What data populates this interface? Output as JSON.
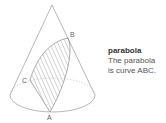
{
  "diagram": {
    "points": {
      "A": "A",
      "B": "B",
      "C": "C"
    },
    "shape": "cone",
    "section": "parabola"
  },
  "caption": {
    "title": "parabola",
    "line1": "The parabola",
    "line2": "is curve ABC."
  },
  "colors": {
    "stroke": "#9a9a9a",
    "text": "#555555"
  }
}
